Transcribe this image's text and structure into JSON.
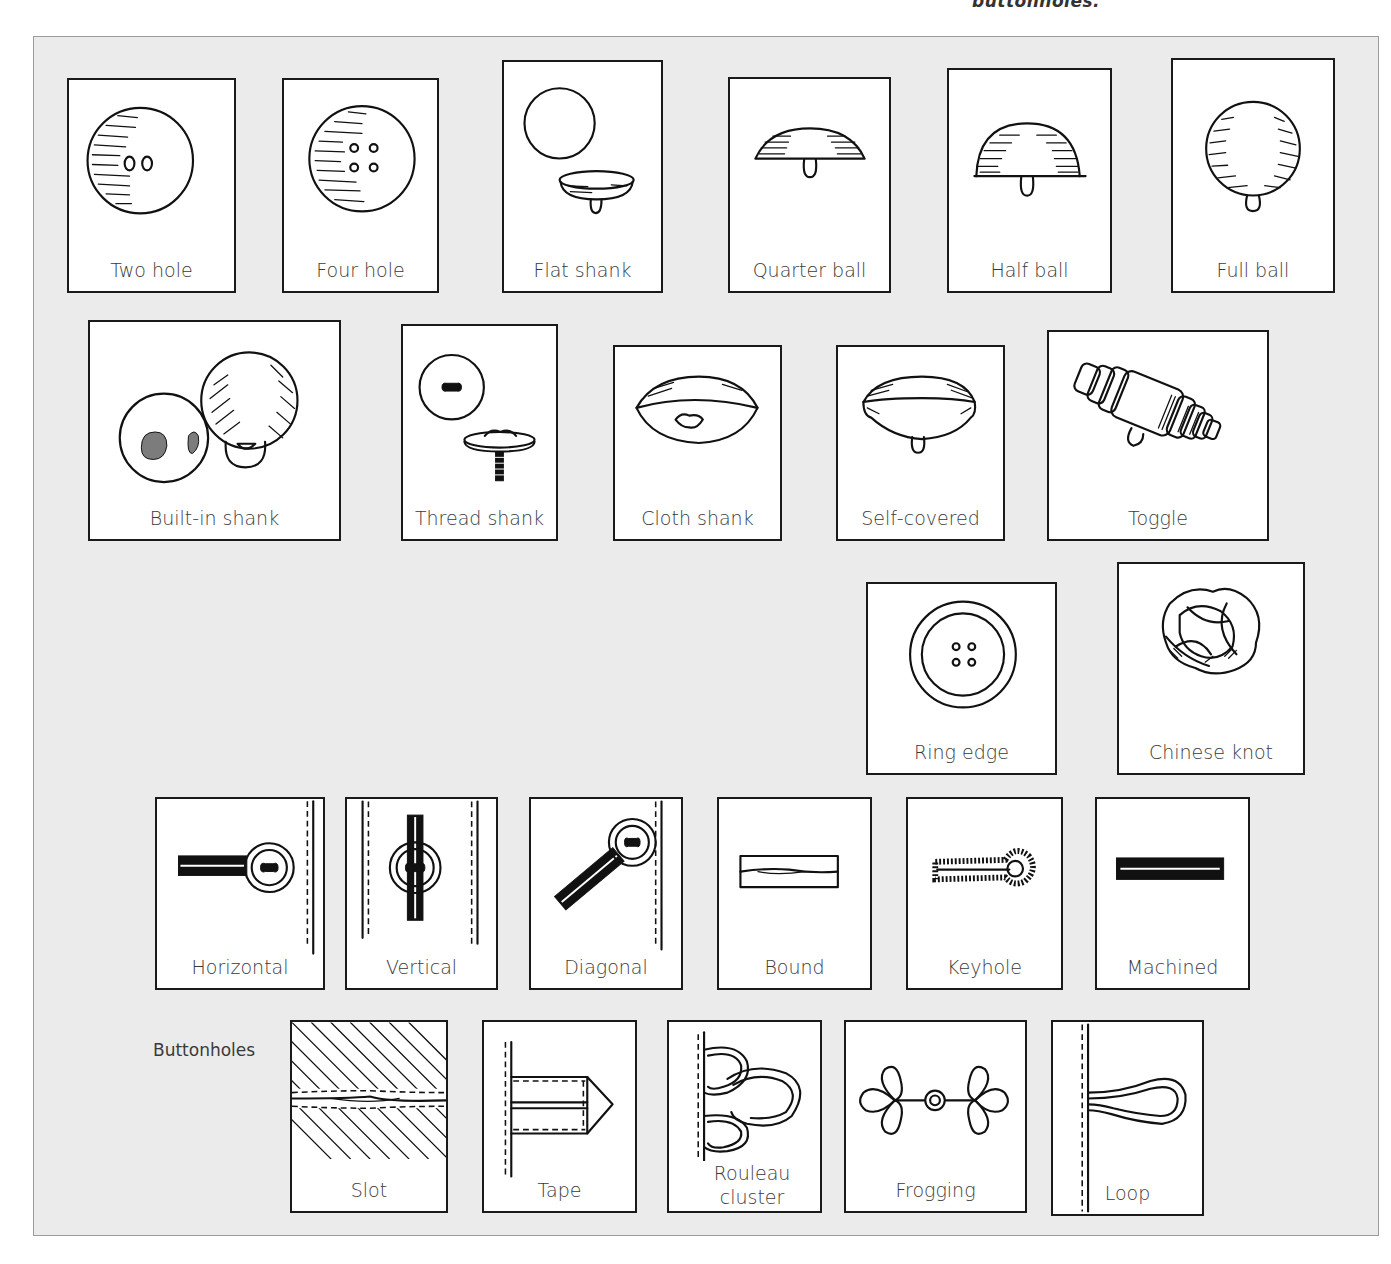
{
  "top_caption": "buttonholes.",
  "panel": {
    "background": "#ebebeb",
    "border_color": "#9a9a9a",
    "card_border_color": "#1a1a1a"
  },
  "section_label": "Buttonholes",
  "buttons": [
    {
      "id": "two-hole",
      "label": "Two hole",
      "icon": "two-hole-button-icon"
    },
    {
      "id": "four-hole",
      "label": "Four hole",
      "icon": "four-hole-button-icon"
    },
    {
      "id": "flat-shank",
      "label": "Flat shank",
      "icon": "flat-shank-button-icon"
    },
    {
      "id": "quarter-ball",
      "label": "Quarter ball",
      "icon": "quarter-ball-button-icon"
    },
    {
      "id": "half-ball",
      "label": "Half ball",
      "icon": "half-ball-button-icon"
    },
    {
      "id": "full-ball",
      "label": "Full ball",
      "icon": "full-ball-button-icon"
    },
    {
      "id": "built-in-shank",
      "label": "Built-in shank",
      "icon": "built-in-shank-button-icon"
    },
    {
      "id": "thread-shank",
      "label": "Thread shank",
      "icon": "thread-shank-button-icon"
    },
    {
      "id": "cloth-shank",
      "label": "Cloth shank",
      "icon": "cloth-shank-button-icon"
    },
    {
      "id": "self-covered",
      "label": "Self-covered",
      "icon": "self-covered-button-icon"
    },
    {
      "id": "toggle",
      "label": "Toggle",
      "icon": "toggle-button-icon"
    },
    {
      "id": "ring-edge",
      "label": "Ring edge",
      "icon": "ring-edge-button-icon"
    },
    {
      "id": "chinese-knot",
      "label": "Chinese knot",
      "icon": "chinese-knot-icon"
    }
  ],
  "buttonholes": [
    {
      "id": "horizontal",
      "label": "Horizontal",
      "icon": "horizontal-buttonhole-icon"
    },
    {
      "id": "vertical",
      "label": "Vertical",
      "icon": "vertical-buttonhole-icon"
    },
    {
      "id": "diagonal",
      "label": "Diagonal",
      "icon": "diagonal-buttonhole-icon"
    },
    {
      "id": "bound",
      "label": "Bound",
      "icon": "bound-buttonhole-icon"
    },
    {
      "id": "keyhole",
      "label": "Keyhole",
      "icon": "keyhole-buttonhole-icon"
    },
    {
      "id": "machined",
      "label": "Machined",
      "icon": "machined-buttonhole-icon"
    },
    {
      "id": "slot",
      "label": "Slot",
      "icon": "slot-buttonhole-icon"
    },
    {
      "id": "tape",
      "label": "Tape",
      "icon": "tape-loop-icon"
    },
    {
      "id": "rouleau-cluster",
      "label": "Rouleau cluster",
      "label_lines": [
        "Rouleau",
        "cluster"
      ],
      "icon": "rouleau-cluster-icon"
    },
    {
      "id": "frogging",
      "label": "Frogging",
      "icon": "frogging-icon"
    },
    {
      "id": "loop",
      "label": "Loop",
      "icon": "loop-icon"
    }
  ]
}
